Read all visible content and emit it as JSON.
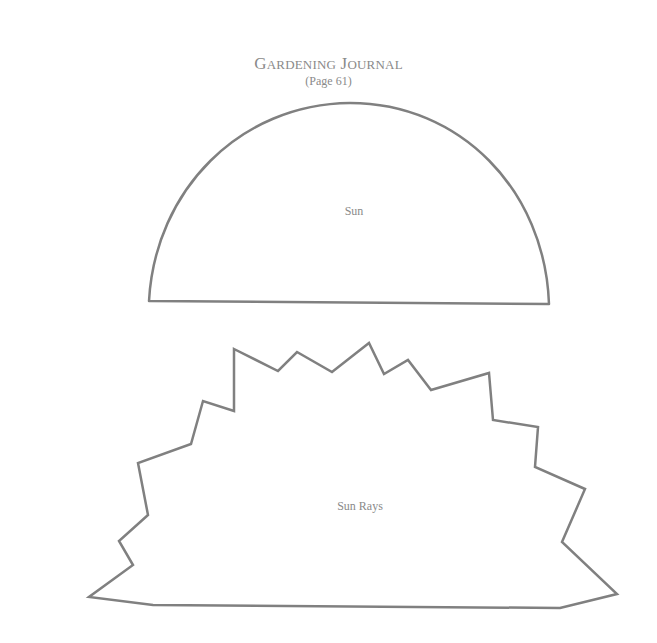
{
  "header": {
    "title_cap1": "G",
    "title_rest1": "ARDENING",
    "title_cap2": "J",
    "title_rest2": "OURNAL",
    "subtitle": "(Page 61)"
  },
  "shapes": {
    "sun": {
      "label": "Sun",
      "stroke": "#808080"
    },
    "sun_rays": {
      "label": "Sun Rays",
      "stroke": "#808080"
    }
  }
}
